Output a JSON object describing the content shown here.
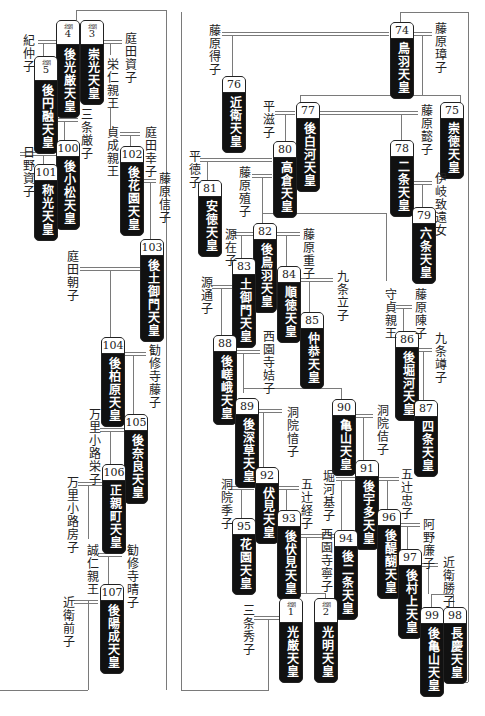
{
  "diagram": {
    "emperors": [
      {
        "id": "e74",
        "num": "74",
        "name": "鳥羽天皇"
      },
      {
        "id": "e75",
        "num": "75",
        "name": "崇徳天皇"
      },
      {
        "id": "e76",
        "num": "76",
        "name": "近衛天皇"
      },
      {
        "id": "e77",
        "num": "77",
        "name": "後白河天皇"
      },
      {
        "id": "e78",
        "num": "78",
        "name": "二条天皇"
      },
      {
        "id": "e79",
        "num": "79",
        "name": "六条天皇"
      },
      {
        "id": "e80",
        "num": "80",
        "name": "高倉天皇"
      },
      {
        "id": "e81",
        "num": "81",
        "name": "安徳天皇"
      },
      {
        "id": "e82",
        "num": "82",
        "name": "後鳥羽天皇"
      },
      {
        "id": "e83",
        "num": "83",
        "name": "土御門天皇"
      },
      {
        "id": "e84",
        "num": "84",
        "name": "順徳天皇"
      },
      {
        "id": "e85",
        "num": "85",
        "name": "仲恭天皇"
      },
      {
        "id": "e86",
        "num": "86",
        "name": "後堀河天皇"
      },
      {
        "id": "e87",
        "num": "87",
        "name": "四条天皇"
      },
      {
        "id": "e88",
        "num": "88",
        "name": "後嵯峨天皇"
      },
      {
        "id": "e89",
        "num": "89",
        "name": "後深草天皇"
      },
      {
        "id": "e90",
        "num": "90",
        "name": "亀山天皇"
      },
      {
        "id": "e91",
        "num": "91",
        "name": "後宇多天皇"
      },
      {
        "id": "e92",
        "num": "92",
        "name": "伏見天皇"
      },
      {
        "id": "e93",
        "num": "93",
        "name": "後伏見天皇"
      },
      {
        "id": "e94",
        "num": "94",
        "name": "後二条天皇"
      },
      {
        "id": "e95",
        "num": "95",
        "name": "花園天皇"
      },
      {
        "id": "e96",
        "num": "96",
        "name": "後醍醐天皇"
      },
      {
        "id": "e97",
        "num": "97",
        "name": "後村上天皇"
      },
      {
        "id": "e98",
        "num": "98",
        "name": "長慶天皇"
      },
      {
        "id": "e99",
        "num": "99",
        "name": "後亀山天皇"
      },
      {
        "id": "n1",
        "tag": "北朝",
        "num": "1",
        "name": "光厳天皇"
      },
      {
        "id": "n2",
        "tag": "北朝",
        "num": "2",
        "name": "光明天皇"
      },
      {
        "id": "n3",
        "tag": "北朝",
        "num": "3",
        "name": "崇光天皇"
      },
      {
        "id": "n4",
        "tag": "北朝",
        "num": "4",
        "name": "後光厳天皇"
      },
      {
        "id": "n5",
        "tag": "北朝",
        "num": "5",
        "name": "後円融天皇"
      },
      {
        "id": "e100",
        "num": "100",
        "name": "後小松天皇"
      },
      {
        "id": "e101",
        "num": "101",
        "name": "称光天皇"
      },
      {
        "id": "e102",
        "num": "102",
        "name": "後花園天皇"
      },
      {
        "id": "e103",
        "num": "103",
        "name": "後土御門天皇"
      },
      {
        "id": "e104",
        "num": "104",
        "name": "後柏原天皇"
      },
      {
        "id": "e105",
        "num": "105",
        "name": "後奈良天皇"
      },
      {
        "id": "e106",
        "num": "106",
        "name": "正親町天皇"
      },
      {
        "id": "e107",
        "num": "107",
        "name": "後陽成天皇"
      }
    ],
    "persons": [
      "藤原璋子",
      "藤原得子",
      "藤原懿子",
      "平滋子",
      "伊岐致遠女",
      "平徳子",
      "藤原殖子",
      "源在子",
      "藤原重子",
      "九条立子",
      "守貞親王",
      "藤原陳子",
      "源通子",
      "九条竴子",
      "西園寺姞子",
      "洞院愔子",
      "洞院佶子",
      "堀河基子",
      "五辻経子",
      "五辻忠子",
      "洞院季子",
      "西園寺寧子",
      "阿野廉子",
      "近衛勝子",
      "三条秀子",
      "紀仲子",
      "庭田資子",
      "栄仁親王",
      "三条厳子",
      "貞成親王",
      "庭田幸子",
      "日野資子",
      "藤原信子",
      "庭田朝子",
      "勧修寺藤子",
      "万里小路栄子",
      "万里小路房子",
      "誠仁親王",
      "勧修寺晴子",
      "近衛前子"
    ]
  }
}
